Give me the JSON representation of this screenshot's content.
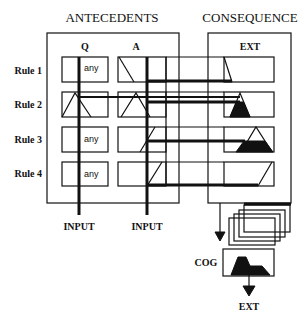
{
  "diagram": {
    "sections": {
      "antecedents": "ANTECEDENTS",
      "consequence": "CONSEQUENCE"
    },
    "columns": {
      "q": "Q",
      "a": "A",
      "ext": "EXT"
    },
    "rules": [
      {
        "label": "Rule 1",
        "q": "any",
        "a_shape": "decreasing-edge",
        "ext_shape": "decreasing-edge"
      },
      {
        "label": "Rule 2",
        "q": "triangle",
        "a_shape": "triangle",
        "ext_shape": "small-triangle-clipped"
      },
      {
        "label": "Rule 3",
        "q": "any",
        "a_shape": "increasing-edge",
        "ext_shape": "large-triangle-clipped"
      },
      {
        "label": "Rule 4",
        "q": "any",
        "a_shape": "increasing-edge",
        "ext_shape": "increasing-edge"
      }
    ],
    "inputs": [
      "INPUT",
      "INPUT"
    ],
    "aggregation": {
      "stacked_outputs": 4,
      "defuzzifier_label": "COG",
      "output_label": "EXT"
    },
    "colors": {
      "ink": "#111111",
      "background": "#ffffff"
    }
  }
}
